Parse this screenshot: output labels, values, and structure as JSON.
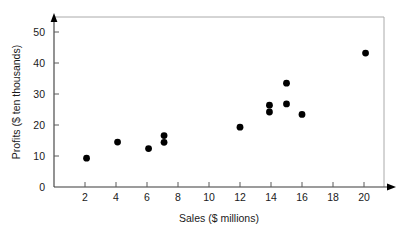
{
  "chart_data": {
    "type": "scatter",
    "title": "",
    "xlabel": "Sales ($ millions)",
    "ylabel": "Profits ($ ten thousands)",
    "xlim": [
      0,
      21.5
    ],
    "ylim": [
      0,
      55
    ],
    "xticks": [
      2,
      4,
      6,
      8,
      10,
      12,
      14,
      16,
      18,
      20
    ],
    "yticks": [
      0,
      10,
      20,
      30,
      40,
      50
    ],
    "xtick_labels": [
      "2",
      "4",
      "6",
      "8",
      "10",
      "12",
      "14",
      "16",
      "18",
      "20"
    ],
    "ytick_labels": [
      "0",
      "10",
      "20",
      "30",
      "40",
      "50"
    ],
    "grid": false,
    "legend": false,
    "legend_position": "none",
    "marker": "filled-circle",
    "marker_color": "#000000",
    "points": [
      {
        "x": 2.1,
        "y": 9.3
      },
      {
        "x": 4.1,
        "y": 14.5
      },
      {
        "x": 6.1,
        "y": 12.4
      },
      {
        "x": 7.1,
        "y": 16.6
      },
      {
        "x": 7.1,
        "y": 14.4
      },
      {
        "x": 12.0,
        "y": 19.3
      },
      {
        "x": 13.9,
        "y": 26.4
      },
      {
        "x": 13.9,
        "y": 24.2
      },
      {
        "x": 15.0,
        "y": 33.5
      },
      {
        "x": 15.0,
        "y": 26.8
      },
      {
        "x": 16.0,
        "y": 23.4
      },
      {
        "x": 20.1,
        "y": 43.2
      }
    ]
  },
  "axes": {
    "x_axis_label": "Sales ($ millions)",
    "y_axis_label": "Profits ($ ten thousands)"
  },
  "colors": {
    "marker": "#000000",
    "axis": "#3a3a3a",
    "frame": "#aaaaaa",
    "text": "#1a1a1a",
    "background": "#ffffff"
  }
}
